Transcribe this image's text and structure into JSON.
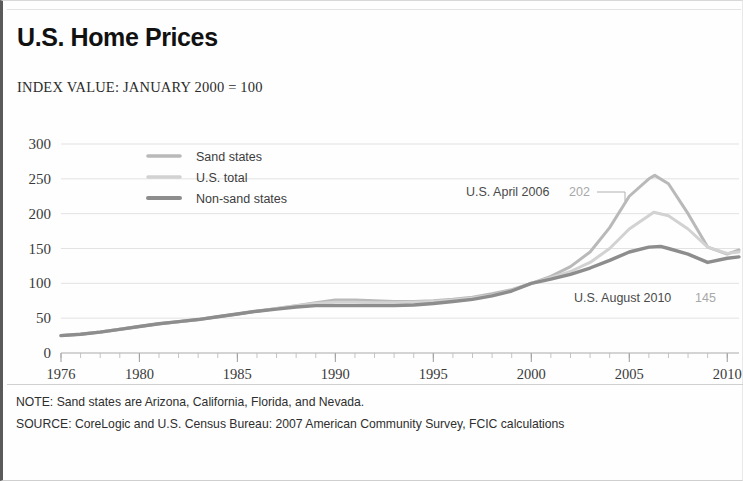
{
  "header": {
    "title": "U.S. Home Prices",
    "subtitle": "INDEX VALUE: JANUARY 2000 = 100"
  },
  "notes": {
    "note": "NOTE: Sand states are Arizona, California, Florida, and Nevada.",
    "source": "SOURCE: CoreLogic and U.S. Census Bureau: 2007 American Community Survey, FCIC calculations"
  },
  "colors": {
    "sand_states": "#b9b9b9",
    "us_total": "#d2d2d2",
    "non_sand_states": "#8d8d8d",
    "grid": "#e2e2e2",
    "axis": "#b8b8b8",
    "text": "#2e2e2e",
    "annotation_value": "#a8a8a8"
  },
  "chart_data": {
    "type": "line",
    "title": "U.S. Home Prices",
    "subtitle": "INDEX VALUE: JANUARY 2000 = 100",
    "xlabel": "",
    "ylabel": "",
    "xlim": [
      1976,
      2010.6
    ],
    "ylim": [
      0,
      300
    ],
    "grid": true,
    "legend_position": "upper-left-inside",
    "y_ticks": [
      0,
      50,
      100,
      150,
      200,
      250,
      300
    ],
    "x_ticks": [
      1976,
      1980,
      1985,
      1990,
      1995,
      2000,
      2005,
      2010
    ],
    "x_minor_tick_step": 1,
    "series": [
      {
        "name": "Sand states",
        "color": "#b9b9b9",
        "width": 3.0,
        "x": [
          1976,
          1977,
          1978,
          1979,
          1980,
          1981,
          1982,
          1983,
          1984,
          1985,
          1986,
          1987,
          1988,
          1989,
          1990,
          1991,
          1992,
          1993,
          1994,
          1995,
          1996,
          1997,
          1998,
          1999,
          2000,
          2001,
          2002,
          2003,
          2004,
          2005,
          2006,
          2006.3,
          2007,
          2008,
          2009,
          2010,
          2010.6
        ],
        "values": [
          25,
          27,
          30,
          34,
          38,
          42,
          45,
          48,
          52,
          56,
          60,
          64,
          68,
          72,
          76,
          76,
          75,
          74,
          74,
          75,
          77,
          80,
          85,
          91,
          100,
          110,
          124,
          145,
          180,
          225,
          250,
          255,
          243,
          200,
          152,
          142,
          148
        ]
      },
      {
        "name": "U.S. total",
        "color": "#d2d2d2",
        "width": 3.0,
        "x": [
          1976,
          1977,
          1978,
          1979,
          1980,
          1981,
          1982,
          1983,
          1984,
          1985,
          1986,
          1987,
          1988,
          1989,
          1990,
          1991,
          1992,
          1993,
          1994,
          1995,
          1996,
          1997,
          1998,
          1999,
          2000,
          2001,
          2002,
          2003,
          2004,
          2005,
          2006.25,
          2007,
          2008,
          2009,
          2010,
          2010.6
        ],
        "values": [
          25,
          27,
          30,
          34,
          38,
          42,
          45,
          48,
          52,
          56,
          60,
          64,
          68,
          71,
          73,
          73,
          72,
          72,
          73,
          74,
          76,
          79,
          83,
          90,
          100,
          108,
          117,
          130,
          150,
          178,
          202,
          197,
          178,
          152,
          143,
          145
        ]
      },
      {
        "name": "Non-sand states",
        "color": "#8d8d8d",
        "width": 3.4,
        "x": [
          1976,
          1977,
          1978,
          1979,
          1980,
          1981,
          1982,
          1983,
          1984,
          1985,
          1986,
          1987,
          1988,
          1989,
          1990,
          1991,
          1992,
          1993,
          1994,
          1995,
          1996,
          1997,
          1998,
          1999,
          2000,
          2001,
          2002,
          2003,
          2004,
          2005,
          2006,
          2006.6,
          2007,
          2008,
          2009,
          2010,
          2010.6
        ],
        "values": [
          25,
          27,
          30,
          34,
          38,
          42,
          45,
          48,
          52,
          56,
          60,
          63,
          66,
          68,
          68,
          68,
          68,
          68,
          69,
          71,
          74,
          77,
          82,
          89,
          100,
          106,
          113,
          122,
          133,
          145,
          152,
          153,
          150,
          142,
          130,
          136,
          138
        ]
      }
    ],
    "annotations": [
      {
        "id": "us-april-2006",
        "label": "U.S. April 2006",
        "value": "202",
        "x": 2006.25,
        "y": 202
      },
      {
        "id": "us-august-2010",
        "label": "U.S. August 2010",
        "value": "145",
        "x": 2010.0,
        "y": 145
      }
    ]
  }
}
